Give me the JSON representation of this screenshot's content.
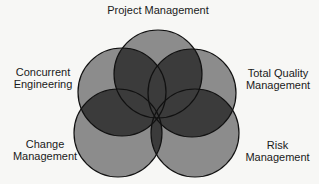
{
  "diagram": {
    "type": "venn",
    "colors": {
      "background": "#f7f7f5",
      "circle_fill": "#8c8c8c",
      "overlap_fill": "#3b3b3b",
      "stroke": "#111111"
    },
    "circles": [
      {
        "id": "project-management",
        "label": "Project Management",
        "cx": 158,
        "cy": 74,
        "r": 44
      },
      {
        "id": "concurrent-engineering",
        "label": "Concurrent\nEngineering",
        "cx": 122,
        "cy": 92,
        "r": 44
      },
      {
        "id": "total-quality-management",
        "label": "Total Quality\nManagement",
        "cx": 192,
        "cy": 93,
        "r": 44
      },
      {
        "id": "change-management",
        "label": "Change\nManagement",
        "cx": 118,
        "cy": 133,
        "r": 44
      },
      {
        "id": "risk-management",
        "label": "Risk\nManagement",
        "cx": 195,
        "cy": 133,
        "r": 44
      }
    ]
  },
  "labels": {
    "project_management": "Project Management",
    "concurrent_engineering": "Concurrent\nEngineering",
    "total_quality_management": "Total Quality\nManagement",
    "change_management": "Change\nManagement",
    "risk_management": "Risk\nManagement"
  }
}
